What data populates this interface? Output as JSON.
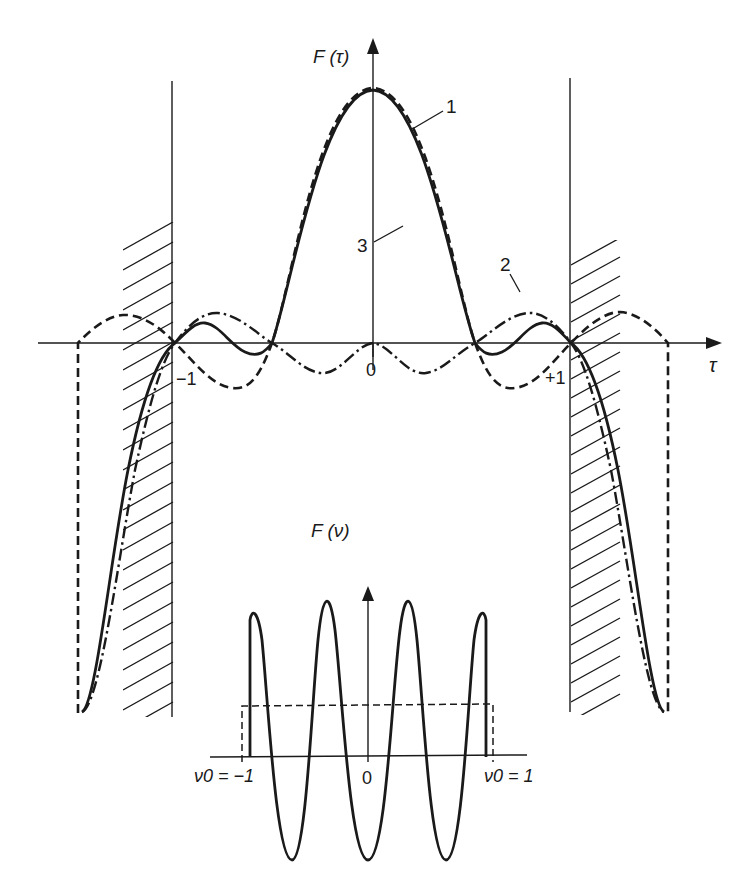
{
  "figure": {
    "type": "diagram",
    "main_plot": {
      "y_axis_label": "F (τ)",
      "x_axis_label": "τ",
      "tick_labels": {
        "minus_one": "−1",
        "zero": "0",
        "plus_one": "+1"
      },
      "curve_labels": {
        "c1": "1",
        "c2": "2",
        "c3": "3"
      },
      "curves": [
        {
          "id": "1",
          "style": "dashed",
          "description": "sinc-like, zero crossings near ±0.5 and ±1, extends beyond ±1 then truncated with vertical drop"
        },
        {
          "id": "2",
          "style": "dash-dot",
          "description": "small ripples near axis, negative lobes between ±0.5 and 0, positive lobes near ±0.75"
        },
        {
          "id": "3",
          "style": "solid",
          "description": "main lobe, small side lobes between ±0.5 and ±1"
        }
      ],
      "hatched_regions": [
        "left of τ = −1",
        "right of τ = +1"
      ]
    },
    "inset_plot": {
      "y_axis_label": "F (ν)",
      "zero_label": "0",
      "left_limit_label": "ν0 = −1",
      "right_limit_label": "ν0 = 1",
      "window": "dashed rectangle from ν0 = −1 to ν0 = 1",
      "curve": "solid cosine oscillation, 4 positive peaks, 3 troughs"
    }
  },
  "colors": {
    "ink": "#1a1a1a",
    "background": "#ffffff"
  }
}
